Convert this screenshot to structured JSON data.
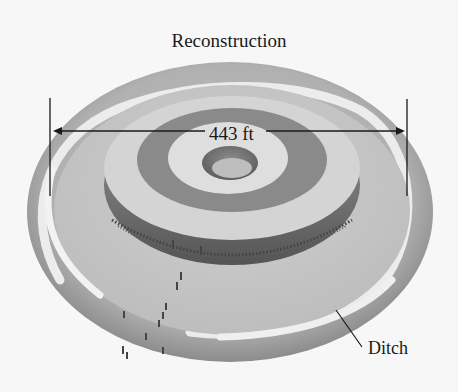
{
  "figure": {
    "title": "Reconstruction",
    "dimension_label": "443 ft",
    "callouts": [
      {
        "label": "Ditch"
      }
    ]
  },
  "colors": {
    "background": "#f7f7f7",
    "outer_bank": "#9a9a9a",
    "ditch": "#e6e6e6",
    "platform": "#c4c4c4",
    "mound_top": "#d8d8d8",
    "center_pit": "#6e6e6e",
    "posts": "#3a3a3a",
    "ink": "#1a1a1a"
  }
}
